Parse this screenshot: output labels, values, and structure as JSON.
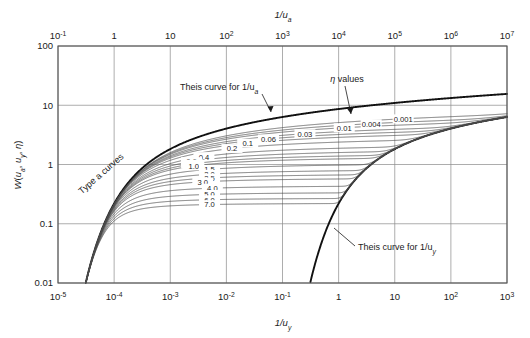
{
  "figure": {
    "background_color": "#ffffff",
    "plot_area": {
      "left": 58,
      "top": 46,
      "right": 507,
      "bottom": 283
    },
    "frame_color": "#555555",
    "grid_color": "#8a8a8a",
    "curve_color": "#4a4a4a",
    "theis_color": "#111111"
  },
  "axes": {
    "top": {
      "title": "1/u",
      "title_sub": "a",
      "labels": [
        "10",
        "1",
        "10",
        "10",
        "10",
        "10",
        "10",
        "10",
        "10"
      ],
      "exponents": [
        "-1",
        "",
        "",
        "2",
        "3",
        "4",
        "5",
        "6",
        "7"
      ],
      "min_exp": -1,
      "max_exp": 7,
      "decades": 8
    },
    "bottom": {
      "title": "1/u",
      "title_sub": "y",
      "labels": [
        "10",
        "10",
        "10",
        "10",
        "10",
        "1",
        "10",
        "10",
        "10"
      ],
      "exponents": [
        "-5",
        "-4",
        "-3",
        "-2",
        "-1",
        "",
        "",
        "2",
        "3"
      ],
      "min_exp": -5,
      "max_exp": 3,
      "decades": 8
    },
    "left": {
      "title_parts": {
        "w": "W",
        "open": "(",
        "ua": "u",
        "ua_sub": "a",
        "sep1": ", ",
        "uy": "u",
        "uy_sub": "y",
        "sep2": ", ",
        "eta": "η",
        "close": ")"
      },
      "labels": [
        "100",
        "10",
        "1",
        "0.1",
        "0.01"
      ],
      "min_exp": -2,
      "max_exp": 2,
      "decades": 4
    }
  },
  "annotations": {
    "theis_a": {
      "text": "Theis curve for 1/u",
      "sub": "a"
    },
    "theis_y": {
      "text": "Theis curve for 1/u",
      "sub": "y"
    },
    "eta_values": {
      "symbol": "η",
      "text": " values"
    },
    "type_a": {
      "text": "Type a curves"
    }
  },
  "chart_data": {
    "type": "line",
    "title": "",
    "xlabel": "1/u_y",
    "ylabel": "W(u_a, u_y, η)",
    "xlim": [
      1e-05,
      1000.0
    ],
    "ylim": [
      0.01,
      100
    ],
    "xscale": "log",
    "yscale": "log",
    "grid": true,
    "legend": "inline-curve-labels",
    "secondary_xaxis": {
      "label": "1/u_a",
      "xlim": [
        0.1,
        10000000.0
      ]
    },
    "eta_labels": [
      "0.001",
      "0.004",
      "0.01",
      "0.03",
      "0.06",
      "0.1",
      "0.2",
      "0.4",
      "0.6",
      "0.8",
      "1.0",
      "1.5",
      "2.0",
      "2.5",
      "3.0",
      "4.0",
      "5.0",
      "6.0",
      "7.0"
    ],
    "series": [
      {
        "name": "Theis curve for 1/u_a",
        "emphasis": true,
        "x": [
          1e-05,
          1.6e-05,
          2.5e-05,
          4e-05,
          6.3e-05,
          0.0001,
          0.0002,
          0.0005,
          0.0015,
          0.005,
          0.02,
          0.1,
          0.5,
          3.0,
          20.0,
          150.0,
          1000.0
        ],
        "y": [
          0.01,
          0.06,
          0.23,
          0.55,
          0.95,
          1.35,
          1.9,
          2.6,
          3.45,
          4.4,
          5.45,
          6.65,
          7.9,
          9.45,
          11.2,
          13.2,
          15.4
        ]
      },
      {
        "name": "Theis curve for 1/u_y",
        "emphasis": true,
        "x": [
          0.2,
          0.3,
          0.5,
          1.0,
          2.0,
          5.0,
          12.0,
          30.0,
          80.0,
          200.0,
          500.0,
          1000.0
        ],
        "y": [
          0.01,
          0.048,
          0.17,
          0.47,
          0.9,
          1.7,
          2.5,
          3.45,
          4.45,
          5.4,
          6.45,
          7.2
        ]
      },
      {
        "name": "0.001",
        "plateau": 12.4
      },
      {
        "name": "0.004",
        "plateau": 9.6
      },
      {
        "name": "0.01",
        "plateau": 7.9
      },
      {
        "name": "0.03",
        "plateau": 6.1
      },
      {
        "name": "0.06",
        "plateau": 5.1
      },
      {
        "name": "0.1",
        "plateau": 4.3
      },
      {
        "name": "0.2",
        "plateau": 3.3
      },
      {
        "name": "0.4",
        "plateau": 2.4
      },
      {
        "name": "0.6",
        "plateau": 1.95
      },
      {
        "name": "0.8",
        "plateau": 1.65
      },
      {
        "name": "1.0",
        "plateau": 1.45
      },
      {
        "name": "1.5",
        "plateau": 1.1
      },
      {
        "name": "2.0",
        "plateau": 0.86
      },
      {
        "name": "2.5",
        "plateau": 0.72
      },
      {
        "name": "3.0",
        "plateau": 0.61
      },
      {
        "name": "4.0",
        "plateau": 0.45
      },
      {
        "name": "5.0",
        "plateau": 0.345
      },
      {
        "name": "6.0",
        "plateau": 0.275
      },
      {
        "name": "7.0",
        "plateau": 0.225
      }
    ]
  }
}
